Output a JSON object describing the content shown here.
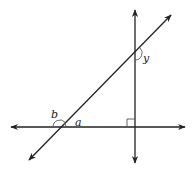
{
  "diagram": {
    "type": "geometry-angles",
    "labels": {
      "angle_a": "a",
      "angle_b": "b",
      "angle_y": "y"
    },
    "colors": {
      "line": "#222222",
      "arc": "#555555",
      "background": "#ffffff"
    },
    "lines": [
      {
        "name": "horizontal-line",
        "x1": 11,
        "y1": 127,
        "x2": 185,
        "y2": 127,
        "arrows": "both"
      },
      {
        "name": "vertical-line",
        "x1": 135,
        "y1": 10,
        "x2": 135,
        "y2": 163,
        "arrows": "both"
      },
      {
        "name": "diagonal-transversal",
        "x1": 29,
        "y1": 160,
        "x2": 171,
        "y2": 15,
        "arrows": "both"
      }
    ],
    "right_angle_marker": {
      "x": 127,
      "y": 119,
      "size": 8
    },
    "intersections": {
      "diagonal_horizontal": [
        60,
        127
      ],
      "diagonal_vertical": [
        135,
        53
      ],
      "horizontal_vertical": [
        135,
        127
      ]
    }
  }
}
